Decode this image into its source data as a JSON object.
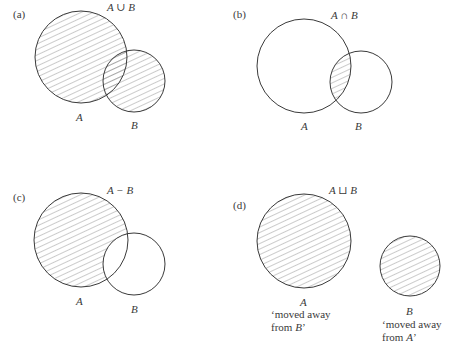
{
  "panels": [
    {
      "tag": "(a)",
      "operation": "A ∪ B",
      "label_a": "A",
      "label_b": "B",
      "shaded": "union"
    },
    {
      "tag": "(b)",
      "operation": "A ∩ B",
      "label_a": "A",
      "label_b": "B",
      "shaded": "intersection"
    },
    {
      "tag": "(c)",
      "operation": "A − B",
      "label_a": "A",
      "label_b": "B",
      "shaded": "difference"
    },
    {
      "tag": "(d)",
      "operation": "A ⊔ B",
      "label_a": "A",
      "label_b": "B",
      "caption_a_line1": "‘moved away",
      "caption_a_line2_prefix": "from ",
      "caption_a_line2_var": "B",
      "caption_a_line2_suffix": "’",
      "caption_b_line1": "‘moved away",
      "caption_b_line2_prefix": "from ",
      "caption_b_line2_var": "A",
      "caption_b_line2_suffix": "’",
      "shaded": "disjoint-union"
    }
  ],
  "colors": {
    "stroke": "#3a3a3a",
    "hatch": "#6a6a6a",
    "background": "#ffffff"
  }
}
